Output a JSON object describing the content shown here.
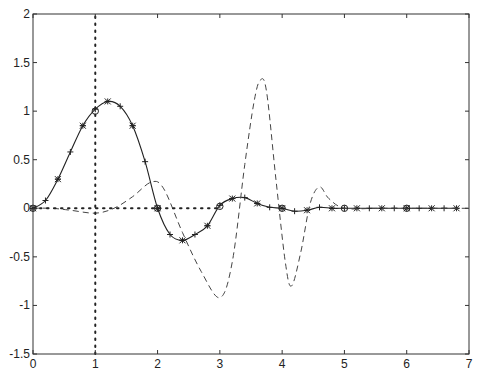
{
  "chart_data": {
    "type": "line",
    "title": "",
    "xlabel": "",
    "ylabel": "",
    "xlim": [
      0,
      7
    ],
    "ylim": [
      -1.5,
      2
    ],
    "grid": false,
    "legend": null,
    "x_ticks": [
      "0",
      "1",
      "2",
      "3",
      "4",
      "5",
      "6",
      "7"
    ],
    "y_ticks": [
      "-1.5",
      "-1",
      "-0.5",
      "0",
      "0.5",
      "1",
      "1.5",
      "2"
    ],
    "series": [
      {
        "name": "solid-curve",
        "style": "solid",
        "markers": [
          "+",
          "*"
        ],
        "x": [
          0,
          0.2,
          0.4,
          0.6,
          0.8,
          1.0,
          1.2,
          1.4,
          1.6,
          1.8,
          2.0,
          2.2,
          2.4,
          2.6,
          2.8,
          3.0,
          3.2,
          3.4,
          3.6,
          3.8,
          4.0,
          4.2,
          4.4,
          4.6,
          4.8,
          5.0,
          5.2,
          5.4,
          5.6,
          5.8,
          6.0,
          6.2,
          6.4,
          6.6,
          6.8
        ],
        "values": [
          0,
          0.08,
          0.3,
          0.58,
          0.85,
          1.02,
          1.1,
          1.05,
          0.85,
          0.48,
          0.0,
          -0.27,
          -0.33,
          -0.27,
          -0.18,
          0.03,
          0.1,
          0.11,
          0.05,
          0.01,
          0.0,
          -0.03,
          -0.02,
          0.01,
          0.0,
          0.0,
          0.0,
          0.0,
          0.0,
          0.0,
          0.0,
          0.0,
          0.0,
          0.0,
          0.0
        ]
      },
      {
        "name": "dashed-curve",
        "style": "dashed",
        "x": [
          0,
          0.3,
          0.6,
          1.0,
          1.3,
          1.6,
          1.9,
          2.1,
          2.4,
          2.7,
          3.0,
          3.2,
          3.4,
          3.55,
          3.65,
          3.75,
          3.9,
          4.05,
          4.15,
          4.3,
          4.45,
          4.6,
          4.75,
          5.0,
          5.5,
          6.0,
          7.0
        ],
        "values": [
          0,
          0,
          -0.02,
          -0.05,
          0.0,
          0.12,
          0.27,
          0.2,
          -0.25,
          -0.65,
          -0.92,
          -0.55,
          0.45,
          1.1,
          1.32,
          1.2,
          0.3,
          -0.55,
          -0.8,
          -0.45,
          0.05,
          0.22,
          0.1,
          0.0,
          0.0,
          0.0,
          0.0
        ]
      },
      {
        "name": "circle-markers",
        "style": "markers-only",
        "markers": [
          "o"
        ],
        "x": [
          0,
          1,
          2,
          3,
          4,
          5,
          6
        ],
        "values": [
          0,
          1.0,
          0.0,
          0.02,
          0.0,
          0.0,
          0.0
        ]
      },
      {
        "name": "vertical-dotted-line",
        "style": "dotted",
        "x": [
          1,
          1
        ],
        "values": [
          -1.5,
          2
        ]
      },
      {
        "name": "horizontal-dotted-line",
        "style": "dotted",
        "x": [
          0,
          3
        ],
        "values": [
          0,
          0
        ]
      }
    ]
  }
}
